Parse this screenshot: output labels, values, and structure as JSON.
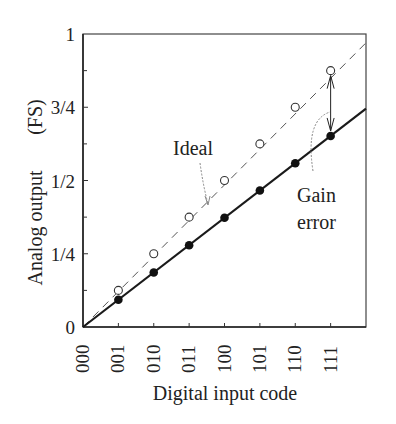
{
  "chart_data": {
    "type": "line",
    "title": "",
    "xlabel": "Digital input code",
    "ylabel": "Analog output",
    "ylabel_unit": "(FS)",
    "categories": [
      "000",
      "001",
      "010",
      "011",
      "100",
      "101",
      "110",
      "111"
    ],
    "x_index": [
      0,
      1,
      2,
      3,
      4,
      5,
      6,
      7
    ],
    "xlim": [
      0,
      8
    ],
    "ylim": [
      0,
      1
    ],
    "yticks": [
      {
        "value": 0,
        "label": "0"
      },
      {
        "value": 0.25,
        "label": "1/4"
      },
      {
        "value": 0.5,
        "label": "1/2"
      },
      {
        "value": 0.75,
        "label": "3/4"
      },
      {
        "value": 1,
        "label": "1"
      }
    ],
    "yminor_ticks": [
      0.125,
      0.375,
      0.625,
      0.875
    ],
    "grid": false,
    "frame": "box",
    "series": [
      {
        "name": "Ideal",
        "style": "dashed",
        "marker": "open-circle",
        "line_end": [
          8,
          0.97
        ],
        "values": [
          0,
          0.125,
          0.25,
          0.375,
          0.5,
          0.625,
          0.75,
          0.875
        ]
      },
      {
        "name": "Actual",
        "style": "solid",
        "marker": "filled-circle",
        "line_end": [
          8,
          0.745
        ],
        "values": [
          0,
          0.093,
          0.186,
          0.279,
          0.373,
          0.466,
          0.559,
          0.652
        ]
      }
    ],
    "annotations": [
      {
        "text": "Ideal",
        "points_to": "ideal-line",
        "x": 3.1,
        "y": 0.425
      },
      {
        "text_lines": [
          "Gain",
          "error"
        ],
        "points_to": "gain-error-arrow",
        "x": 6.4,
        "y": 0.4
      },
      {
        "type": "double-arrow",
        "x": 7,
        "from": 0.652,
        "to": 0.875,
        "label": "Gain error"
      }
    ]
  },
  "labels": {
    "ideal": "Ideal",
    "gain_line1": "Gain",
    "gain_line2": "error",
    "xlabel": "Digital input code",
    "ylabel": "Analog output",
    "ylabel_unit": "(FS)"
  },
  "colors": {
    "axis": "#444444",
    "line": "#1a1a1a",
    "dashed": "#555555",
    "marker_fill": "#111111",
    "annotation_leader": "#888888",
    "background": "#ffffff"
  }
}
